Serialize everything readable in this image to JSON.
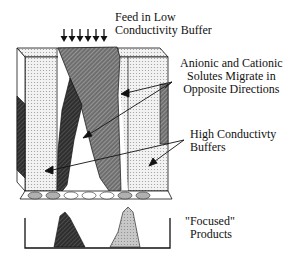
{
  "diagram": {
    "labels": {
      "feed_line1": "Feed in Low",
      "feed_line2": "Conductivity Buffer",
      "migrate_line1": "Anionic and Cationic",
      "migrate_line2": "Solutes Migrate in",
      "migrate_line3": "Opposite Directions",
      "buffers_line1": "High Conductivty",
      "buffers_line2": "Buffers",
      "products_line1": "\"Focused\"",
      "products_line2": "Products"
    },
    "colors": {
      "stipple": "#d9d9d9",
      "dark_band": "#3a3a3a",
      "medium_band": "#7a7a7a",
      "light_peak": "#bdbdbd",
      "outline": "#111111"
    },
    "feed_arrow_count": 6
  }
}
